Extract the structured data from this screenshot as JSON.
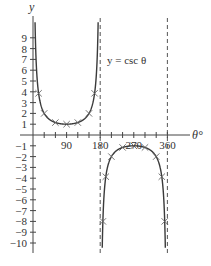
{
  "chart_data": {
    "type": "line",
    "title": "",
    "function_label": "y = csc θ",
    "xlabel": "θ°",
    "ylabel": "y",
    "xlim": [
      0,
      360
    ],
    "ylim": [
      -10,
      10
    ],
    "x_ticks_step": 30,
    "x_tick_labels": [
      {
        "value": 90,
        "label": "90"
      },
      {
        "value": 180,
        "label": "180"
      },
      {
        "value": 270,
        "label": "270"
      },
      {
        "value": 360,
        "label": "360"
      }
    ],
    "y_tick_labels": [
      {
        "value": 9,
        "label": "9"
      },
      {
        "value": 8,
        "label": "8"
      },
      {
        "value": 7,
        "label": "7"
      },
      {
        "value": 6,
        "label": "6"
      },
      {
        "value": 5,
        "label": "5"
      },
      {
        "value": 4,
        "label": "4"
      },
      {
        "value": 3,
        "label": "3"
      },
      {
        "value": 2,
        "label": "2"
      },
      {
        "value": 1,
        "label": "1"
      },
      {
        "value": -1,
        "label": "−1"
      },
      {
        "value": -2,
        "label": "−2"
      },
      {
        "value": -3,
        "label": "−3"
      },
      {
        "value": -4,
        "label": "−4"
      },
      {
        "value": -5,
        "label": "−5"
      },
      {
        "value": -6,
        "label": "−6"
      },
      {
        "value": -7,
        "label": "−7"
      },
      {
        "value": -8,
        "label": "−8"
      },
      {
        "value": -9,
        "label": "−9"
      },
      {
        "value": -10,
        "label": "−10"
      }
    ],
    "asymptotes": [
      180,
      360
    ],
    "series": [
      {
        "name": "y = csc θ",
        "marked_points": [
          {
            "x": 15,
            "y": 3.86
          },
          {
            "x": 30,
            "y": 2
          },
          {
            "x": 60,
            "y": 1.15
          },
          {
            "x": 90,
            "y": 1
          },
          {
            "x": 120,
            "y": 1.15
          },
          {
            "x": 150,
            "y": 2
          },
          {
            "x": 165,
            "y": 3.86
          },
          {
            "x": 187.2,
            "y": -8
          },
          {
            "x": 195,
            "y": -3.86
          },
          {
            "x": 210,
            "y": -2
          },
          {
            "x": 240,
            "y": -1.15
          },
          {
            "x": 270,
            "y": -1
          },
          {
            "x": 300,
            "y": -1.15
          },
          {
            "x": 330,
            "y": -2
          },
          {
            "x": 345,
            "y": -3.86
          },
          {
            "x": 352.8,
            "y": -8
          }
        ]
      }
    ],
    "grid": false,
    "legend": "none",
    "colors": {
      "curve": "#3a3a3a",
      "axis": "#444444",
      "asymptote": "#555555",
      "marker": "#666666"
    }
  }
}
